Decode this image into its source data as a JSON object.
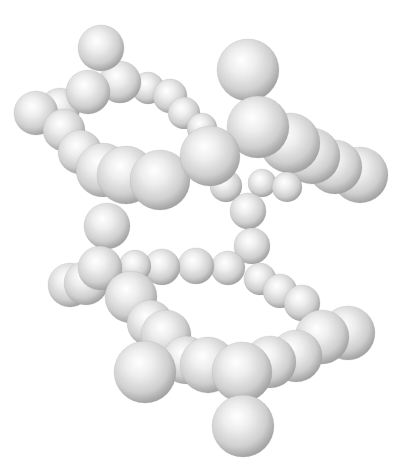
{
  "image": {
    "width": 397,
    "height": 471,
    "background": "#ffffff",
    "subject": "3D ball model of a molecular-like chain forming two stacked loops",
    "sphere_colors": {
      "highlight": "#ffffff",
      "mid": "#dcdcdc",
      "shade": "#a9a9a9",
      "edge": "#8f8f8f"
    }
  },
  "spheres": [
    {
      "cx": 248,
      "cy": 70,
      "r": 31,
      "group": "top-isolated"
    },
    {
      "cx": 360,
      "cy": 175,
      "r": 28,
      "group": "upper-right-chain"
    },
    {
      "cx": 335,
      "cy": 167,
      "r": 27,
      "group": "upper-right-chain"
    },
    {
      "cx": 312,
      "cy": 156,
      "r": 28,
      "group": "upper-right-chain"
    },
    {
      "cx": 290,
      "cy": 143,
      "r": 30,
      "group": "upper-right-chain"
    },
    {
      "cx": 262,
      "cy": 183,
      "r": 14,
      "group": "upper-right-small"
    },
    {
      "cx": 287,
      "cy": 187,
      "r": 15,
      "group": "upper-right-small"
    },
    {
      "cx": 226,
      "cy": 186,
      "r": 16,
      "group": "upper-right-small"
    },
    {
      "cx": 258,
      "cy": 127,
      "r": 31,
      "group": "upper-right-chain"
    },
    {
      "cx": 148,
      "cy": 88,
      "r": 16,
      "group": "upper-loop"
    },
    {
      "cx": 170,
      "cy": 96,
      "r": 17,
      "group": "upper-loop"
    },
    {
      "cx": 184,
      "cy": 113,
      "r": 16,
      "group": "upper-loop"
    },
    {
      "cx": 202,
      "cy": 128,
      "r": 15,
      "group": "upper-loop"
    },
    {
      "cx": 120,
      "cy": 82,
      "r": 21,
      "group": "upper-loop"
    },
    {
      "cx": 60,
      "cy": 108,
      "r": 20,
      "group": "upper-loop"
    },
    {
      "cx": 88,
      "cy": 92,
      "r": 22,
      "group": "upper-loop"
    },
    {
      "cx": 101,
      "cy": 48,
      "r": 23,
      "group": "upper-cap"
    },
    {
      "cx": 36,
      "cy": 113,
      "r": 22,
      "group": "upper-loop"
    },
    {
      "cx": 64,
      "cy": 130,
      "r": 21,
      "group": "upper-loop"
    },
    {
      "cx": 80,
      "cy": 152,
      "r": 22,
      "group": "upper-front"
    },
    {
      "cx": 103,
      "cy": 170,
      "r": 27,
      "group": "upper-front"
    },
    {
      "cx": 126,
      "cy": 175,
      "r": 29,
      "group": "upper-front"
    },
    {
      "cx": 160,
      "cy": 180,
      "r": 30,
      "group": "upper-front"
    },
    {
      "cx": 210,
      "cy": 156,
      "r": 30,
      "group": "upper-front"
    },
    {
      "cx": 248,
      "cy": 211,
      "r": 18,
      "group": "connector-right"
    },
    {
      "cx": 252,
      "cy": 246,
      "r": 18,
      "group": "connector-right"
    },
    {
      "cx": 107,
      "cy": 226,
      "r": 23,
      "group": "connector-left"
    },
    {
      "cx": 228,
      "cy": 268,
      "r": 17,
      "group": "lower-loop"
    },
    {
      "cx": 196,
      "cy": 266,
      "r": 18,
      "group": "lower-loop"
    },
    {
      "cx": 162,
      "cy": 267,
      "r": 18,
      "group": "lower-loop"
    },
    {
      "cx": 135,
      "cy": 266,
      "r": 16,
      "group": "lower-loop"
    },
    {
      "cx": 70,
      "cy": 285,
      "r": 22,
      "group": "lower-loop"
    },
    {
      "cx": 86,
      "cy": 283,
      "r": 22,
      "group": "lower-loop"
    },
    {
      "cx": 100,
      "cy": 268,
      "r": 22,
      "group": "lower-loop"
    },
    {
      "cx": 131,
      "cy": 297,
      "r": 26,
      "group": "lower-loop"
    },
    {
      "cx": 260,
      "cy": 279,
      "r": 16,
      "group": "lower-right"
    },
    {
      "cx": 280,
      "cy": 291,
      "r": 17,
      "group": "lower-right"
    },
    {
      "cx": 302,
      "cy": 303,
      "r": 18,
      "group": "lower-right"
    },
    {
      "cx": 348,
      "cy": 333,
      "r": 27,
      "group": "lower-right"
    },
    {
      "cx": 322,
      "cy": 337,
      "r": 27,
      "group": "lower-right"
    },
    {
      "cx": 150,
      "cy": 323,
      "r": 23,
      "group": "lower-front"
    },
    {
      "cx": 166,
      "cy": 335,
      "r": 25,
      "group": "lower-front"
    },
    {
      "cx": 296,
      "cy": 356,
      "r": 26,
      "group": "lower-front"
    },
    {
      "cx": 270,
      "cy": 362,
      "r": 26,
      "group": "lower-front"
    },
    {
      "cx": 186,
      "cy": 360,
      "r": 24,
      "group": "lower-front"
    },
    {
      "cx": 208,
      "cy": 365,
      "r": 28,
      "group": "lower-front"
    },
    {
      "cx": 242,
      "cy": 372,
      "r": 30,
      "group": "lower-front"
    },
    {
      "cx": 145,
      "cy": 372,
      "r": 31,
      "group": "lower-front"
    },
    {
      "cx": 243,
      "cy": 426,
      "r": 31,
      "group": "bottom-pendant"
    }
  ]
}
